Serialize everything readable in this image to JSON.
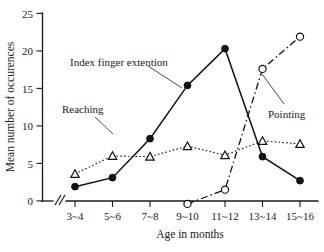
{
  "chart_data": {
    "type": "line",
    "title": "",
    "xlabel": "Age in months",
    "ylabel": "Mean number of occurences",
    "categories": [
      "3~4",
      "5~6",
      "7~8",
      "9~10",
      "11~12",
      "13~14",
      "15~16"
    ],
    "ylim": [
      0,
      25
    ],
    "yticks": [
      0,
      5,
      10,
      15,
      20,
      25
    ],
    "ytick_labels": [
      "0",
      "5",
      "10",
      "15",
      "20",
      "25"
    ],
    "grid": false,
    "legend_position": "inline-annotations",
    "x_axis_break": true,
    "series": [
      {
        "name": "Index finger extention",
        "marker": "filled-circle",
        "line_style": "solid",
        "values": [
          1.9,
          3.1,
          8.3,
          15.4,
          20.3,
          5.9,
          2.7
        ]
      },
      {
        "name": "Reaching",
        "marker": "open-triangle",
        "line_style": "dotted",
        "values": [
          3.6,
          6.0,
          5.9,
          7.3,
          6.1,
          8.0,
          7.6
        ]
      },
      {
        "name": "Pointing",
        "marker": "open-circle",
        "line_style": "dash-dot",
        "values": [
          null,
          null,
          null,
          -0.4,
          1.5,
          17.6,
          21.9
        ]
      }
    ],
    "annotations": [
      {
        "text": "Index finger extention",
        "series": "Index finger extention"
      },
      {
        "text": "Reaching",
        "series": "Reaching"
      },
      {
        "text": "Pointing",
        "series": "Pointing"
      }
    ],
    "colors": {
      "ink": "#111111",
      "background": "#ffffff"
    }
  },
  "axes": {
    "y_title": "Mean number of occurences",
    "x_title": "Age in months",
    "y_ticks": [
      "25",
      "20",
      "15",
      "10",
      "5",
      "0"
    ],
    "x_ticks": [
      "3~4",
      "5~6",
      "7~8",
      "9~10",
      "11~12",
      "13~14",
      "15~16"
    ]
  },
  "annotations": {
    "index_finger": "Index finger extention",
    "reaching": "Reaching",
    "pointing": "Pointing"
  }
}
